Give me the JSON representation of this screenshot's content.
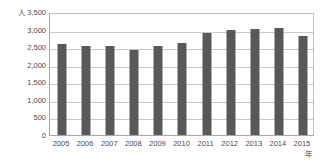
{
  "chart_data": {
    "type": "bar",
    "title": "",
    "subtitle": "",
    "xlabel": "年",
    "ylabel": "人",
    "categories": [
      "2005",
      "2006",
      "2007",
      "2008",
      "2009",
      "2010",
      "2011",
      "2012",
      "2013",
      "2014",
      "2015"
    ],
    "values": [
      2580,
      2540,
      2520,
      2430,
      2540,
      2620,
      2900,
      3000,
      3010,
      3040,
      2810
    ],
    "series": [
      {
        "name": "人数",
        "values": [
          2580,
          2540,
          2520,
          2430,
          2540,
          2620,
          2900,
          3000,
          3010,
          3040,
          2810
        ]
      }
    ],
    "ylim": [
      0,
      3500
    ],
    "ytick_values": [
      0,
      500,
      1000,
      1500,
      2000,
      2500,
      3000,
      3500
    ],
    "ytick_labels": [
      "0",
      "500",
      "1,000",
      "1,500",
      "2,000",
      "2,500",
      "3,000",
      "3,500"
    ],
    "grid": true,
    "grid_axis": "y",
    "legend": false,
    "legend_position": "none",
    "bar_color": "#595959",
    "gridline_color": "#c9c9c9",
    "axis_color": "#a6a6a6",
    "background_color": "#ffffff"
  }
}
